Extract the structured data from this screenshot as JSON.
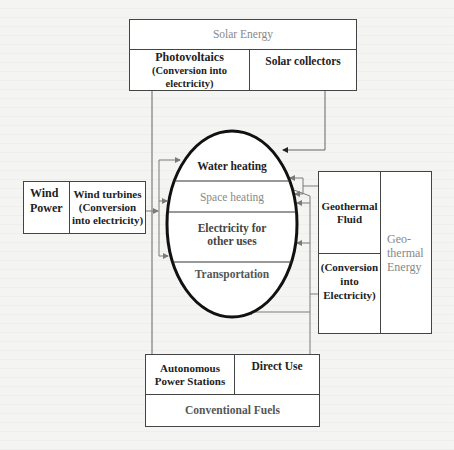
{
  "diagram": {
    "solar": {
      "header": "Solar Energy",
      "left_title": "Photovoltaics",
      "left_sub": "(Conversion into electricity)",
      "right_title": "Solar collectors"
    },
    "wind": {
      "left": "Wind Power",
      "right_line1": "Wind turbines",
      "right_line2": "(Conversion",
      "right_line3": "into electricity)"
    },
    "geothermal": {
      "top_left_line1": "Geothermal",
      "top_left_line2": "Fluid",
      "bottom_left_line1": "(Conversion",
      "bottom_left_line2": "into",
      "bottom_left_line3": "Electricity)",
      "right_line1": "Geo-",
      "right_line2": "thermal",
      "right_line3": "Energy"
    },
    "uses": {
      "water_heating": "Water heating",
      "space_heating": "Space heating",
      "electricity_line1": "Electricity for",
      "electricity_line2": "other uses",
      "transportation": "Transportation"
    },
    "conventional": {
      "left_line1": "Autonomous",
      "left_line2": "Power Stations",
      "right": "Direct Use",
      "bottom": "Conventional Fuels"
    }
  },
  "colors": {
    "line": "#444444",
    "connector": "#7a7a7a",
    "ellipse": "#111111",
    "background": "#f4f4f2"
  }
}
